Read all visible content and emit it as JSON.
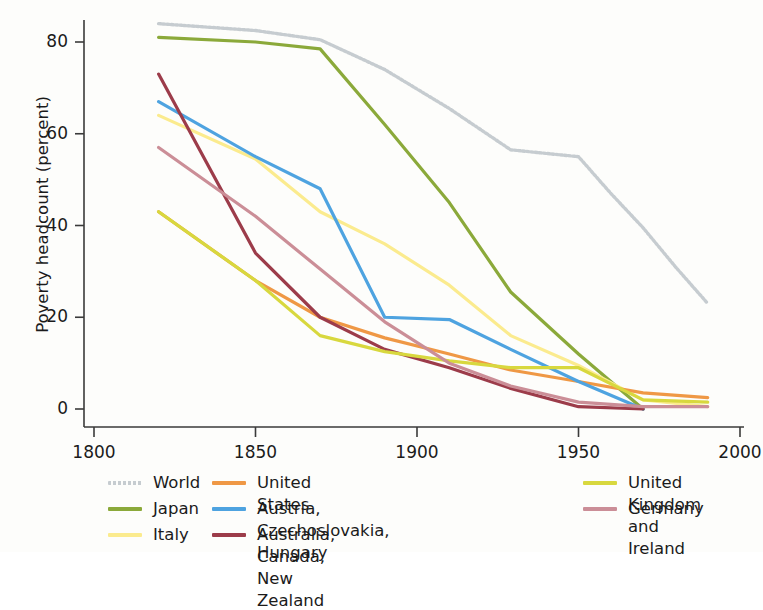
{
  "chart_data": {
    "type": "line",
    "title": "",
    "xlabel": "",
    "ylabel": "Poverty headcount (percent)",
    "xlim": [
      1800,
      2000
    ],
    "ylim": [
      0,
      88
    ],
    "xticks": [
      1800,
      1850,
      1900,
      1950,
      2000
    ],
    "yticks": [
      0,
      20,
      40,
      60,
      80
    ],
    "grid": false,
    "legend_position": "below",
    "series": [
      {
        "name": "World",
        "color": "#c6ccd0",
        "style": "dotted",
        "x": [
          1820,
          1850,
          1870,
          1890,
          1910,
          1929,
          1950,
          1960,
          1970,
          1980,
          1990
        ],
        "values": [
          84.0,
          82.5,
          80.5,
          74.0,
          65.5,
          56.5,
          55.0,
          47.0,
          39.5,
          31.0,
          23.0
        ]
      },
      {
        "name": "Japan",
        "color": "#8ba93a",
        "style": "solid",
        "x": [
          1820,
          1850,
          1870,
          1890,
          1910,
          1929,
          1950,
          1970
        ],
        "values": [
          81.0,
          80.0,
          78.5,
          62.0,
          45.0,
          25.5,
          12.0,
          0.0
        ]
      },
      {
        "name": "Italy",
        "color": "#fbeb8e",
        "style": "solid",
        "x": [
          1820,
          1850,
          1870,
          1890,
          1910,
          1929,
          1950,
          1970,
          1990
        ],
        "values": [
          64.0,
          54.5,
          43.0,
          36.0,
          27.0,
          16.0,
          9.5,
          2.0,
          0.5
        ]
      },
      {
        "name": "United States",
        "color": "#ef9845",
        "style": "solid",
        "x": [
          1820,
          1850,
          1870,
          1890,
          1910,
          1929,
          1950,
          1970,
          1990
        ],
        "values": [
          43.0,
          28.0,
          20.0,
          15.5,
          12.0,
          8.5,
          6.0,
          3.5,
          2.5
        ]
      },
      {
        "name": "Austria, Czechoslovakia, Hungary",
        "color": "#4ea3e0",
        "style": "solid",
        "x": [
          1820,
          1850,
          1870,
          1890,
          1910,
          1929,
          1950,
          1970
        ],
        "values": [
          67.0,
          55.0,
          48.0,
          20.0,
          19.5,
          13.0,
          6.0,
          0.0
        ]
      },
      {
        "name": "Australia, Canada, New Zealand",
        "color": "#9c3c4a",
        "style": "solid",
        "x": [
          1820,
          1850,
          1870,
          1890,
          1910,
          1929,
          1950,
          1970
        ],
        "values": [
          73.0,
          34.0,
          20.0,
          13.0,
          9.0,
          4.5,
          0.5,
          0.0
        ]
      },
      {
        "name": "United Kingdom and Ireland",
        "color": "#d8d83e",
        "style": "solid",
        "x": [
          1820,
          1850,
          1870,
          1890,
          1910,
          1929,
          1950,
          1970,
          1990
        ],
        "values": [
          43.0,
          28.0,
          16.0,
          12.5,
          10.5,
          9.0,
          9.0,
          2.0,
          1.5
        ]
      },
      {
        "name": "Germany",
        "color": "#cb8e97",
        "style": "solid",
        "x": [
          1820,
          1850,
          1870,
          1890,
          1910,
          1929,
          1950,
          1970,
          1990
        ],
        "values": [
          57.0,
          42.0,
          30.5,
          19.0,
          10.0,
          5.0,
          1.5,
          0.5,
          0.5
        ]
      }
    ]
  },
  "axes": {
    "ylabel": "Poverty headcount (percent)",
    "ytick_labels": [
      "80",
      "60",
      "40",
      "20",
      "0"
    ],
    "xtick_labels": [
      "1800",
      "1850",
      "1900",
      "1950",
      "2000"
    ]
  },
  "legend": {
    "columns": [
      {
        "left": 108,
        "entries": [
          {
            "label": "World",
            "color": "#c6ccd0",
            "style": "dotted"
          },
          {
            "label": "Japan",
            "color": "#8ba93a",
            "style": "solid"
          },
          {
            "label": "Italy",
            "color": "#fbeb8e",
            "style": "solid"
          }
        ]
      },
      {
        "left": 212,
        "entries": [
          {
            "label": "United States",
            "color": "#ef9845",
            "style": "solid"
          },
          {
            "label": "Austria, Czechoslovakia, Hungary",
            "color": "#4ea3e0",
            "style": "solid"
          },
          {
            "label": "Australia, Canada, New Zealand",
            "color": "#9c3c4a",
            "style": "solid"
          }
        ]
      },
      {
        "left": 583,
        "entries": [
          {
            "label": "United Kingdom\nand Ireland",
            "color": "#d8d83e",
            "style": "solid"
          },
          {
            "label": "Germany",
            "color": "#cb8e97",
            "style": "solid"
          }
        ]
      }
    ]
  }
}
